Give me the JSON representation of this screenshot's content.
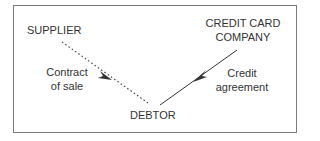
{
  "diagram": {
    "nodes": {
      "supplier": "SUPPLIER",
      "credit_card_company_line1": "CREDIT CARD",
      "credit_card_company_line2": "COMPANY",
      "debtor": "DEBTOR"
    },
    "edges": [
      {
        "from": "SUPPLIER",
        "to": "DEBTOR",
        "style": "dotted",
        "label_line1": "Contract",
        "label_line2": "of sale"
      },
      {
        "from": "CREDIT CARD COMPANY",
        "to": "DEBTOR",
        "style": "solid",
        "label_line1": "Credit",
        "label_line2": "agreement"
      }
    ],
    "colors": {
      "border": "#7a7a7a",
      "text": "#333333",
      "line": "#333333"
    }
  }
}
